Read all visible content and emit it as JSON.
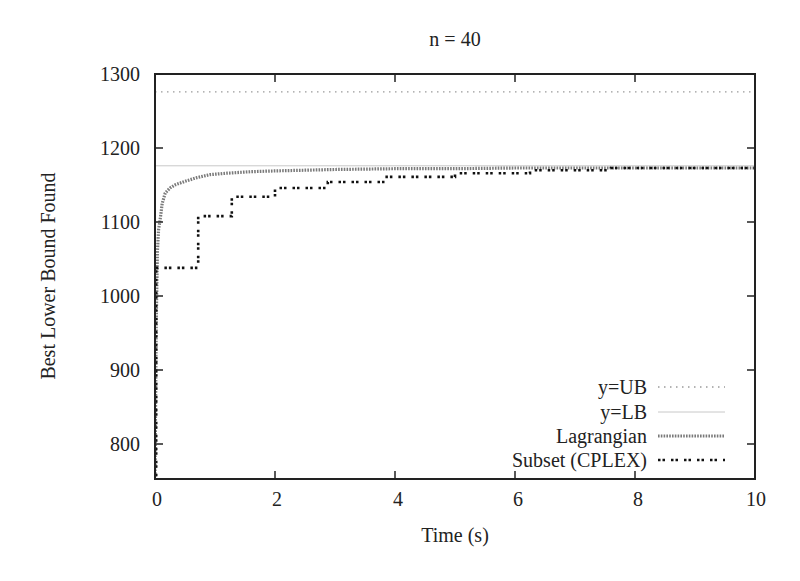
{
  "chart_data": {
    "type": "line",
    "title": "n = 40",
    "xlabel": "Time (s)",
    "ylabel": "Best Lower Bound Found",
    "xlim": [
      0,
      10
    ],
    "ylim": [
      752,
      1300
    ],
    "xticks": [
      0,
      2,
      4,
      6,
      8,
      10
    ],
    "xtick_labels": [
      "0",
      "2",
      "4",
      "6",
      "8",
      "10"
    ],
    "yticks": [
      800,
      900,
      1000,
      1100,
      1200,
      1300
    ],
    "ytick_labels": [
      "800",
      "900",
      "1000",
      "1100",
      "1200",
      "1300"
    ],
    "grid": false,
    "legend_position": "lower right",
    "series": [
      {
        "name": "y=UB",
        "style": "dotted",
        "color": "#9a9a9a",
        "x": [
          0,
          10
        ],
        "y": [
          1276,
          1276
        ]
      },
      {
        "name": "y=LB",
        "style": "thin-solid",
        "color": "#c8c8c8",
        "x": [
          0,
          10
        ],
        "y": [
          1176,
          1176
        ]
      },
      {
        "name": "Lagrangian",
        "style": "hatched",
        "color": "#7a7a7a",
        "x": [
          0,
          0.02,
          0.04,
          0.06,
          0.08,
          0.12,
          0.17,
          0.25,
          0.33,
          0.5,
          0.7,
          0.92,
          1.2,
          1.6,
          2.0,
          2.5,
          3.0,
          4.0,
          5.0,
          6.0,
          7.0,
          8.0,
          9.0,
          10.0
        ],
        "y": [
          752,
          960,
          1060,
          1090,
          1100,
          1125,
          1139,
          1146,
          1150,
          1155,
          1160,
          1164,
          1166,
          1168,
          1169,
          1170,
          1171,
          1172,
          1172,
          1173,
          1173,
          1173,
          1173,
          1173
        ]
      },
      {
        "name": "Subset (CPLEX)",
        "style": "dashed-dotted-black",
        "color": "#111111",
        "step": true,
        "x": [
          0,
          0.02,
          0.28,
          0.72,
          1.28,
          2.0,
          2.88,
          3.83,
          5.0,
          6.25,
          7.6,
          10.0
        ],
        "y": [
          752,
          1038,
          1038,
          1108,
          1134,
          1146,
          1154,
          1161,
          1166,
          1170,
          1173,
          1173
        ]
      }
    ]
  }
}
